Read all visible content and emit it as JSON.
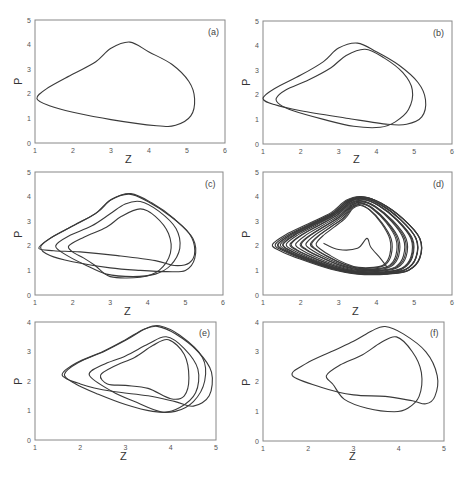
{
  "chart_data": [
    {
      "type": "line",
      "panel": "(a)",
      "xlabel": "Z",
      "ylabel": "P",
      "xlim": [
        1,
        6
      ],
      "ylim": [
        0,
        5
      ],
      "xticks": [
        "1",
        "2",
        "3",
        "4",
        "5",
        "6"
      ],
      "yticks": [
        "0",
        "1",
        "2",
        "3",
        "4",
        "5"
      ],
      "box": [
        35,
        20,
        225,
        143
      ],
      "series": [
        {
          "name": "period-1 orbit",
          "points": [
            [
              1.05,
              1.8
            ],
            [
              1.3,
              2.2
            ],
            [
              2.0,
              2.8
            ],
            [
              2.6,
              3.3
            ],
            [
              3.0,
              3.85
            ],
            [
              3.5,
              4.1
            ],
            [
              4.0,
              3.7
            ],
            [
              4.6,
              3.2
            ],
            [
              5.05,
              2.5
            ],
            [
              5.2,
              1.8
            ],
            [
              5.1,
              1.1
            ],
            [
              4.7,
              0.72
            ],
            [
              4.2,
              0.7
            ],
            [
              3.0,
              0.95
            ],
            [
              2.0,
              1.25
            ],
            [
              1.4,
              1.5
            ],
            [
              1.05,
              1.8
            ]
          ]
        }
      ]
    },
    {
      "type": "line",
      "panel": "(b)",
      "xlabel": "Z",
      "ylabel": "P",
      "xlim": [
        1,
        6
      ],
      "ylim": [
        0,
        5
      ],
      "xticks": [
        "1",
        "2",
        "3",
        "4",
        "5",
        "6"
      ],
      "yticks": [
        "0",
        "1",
        "2",
        "3",
        "4",
        "5"
      ],
      "box": [
        263,
        21,
        452,
        144
      ],
      "series": [
        {
          "name": "outer loop",
          "points": [
            [
              1.0,
              1.85
            ],
            [
              1.3,
              2.25
            ],
            [
              2.0,
              2.8
            ],
            [
              2.6,
              3.35
            ],
            [
              3.0,
              3.9
            ],
            [
              3.5,
              4.1
            ],
            [
              4.0,
              3.75
            ],
            [
              4.6,
              3.2
            ],
            [
              5.1,
              2.5
            ],
            [
              5.3,
              1.8
            ],
            [
              5.2,
              1.1
            ],
            [
              4.8,
              0.8
            ],
            [
              4.3,
              0.8
            ],
            [
              3.2,
              1.05
            ],
            [
              2.0,
              1.35
            ],
            [
              1.3,
              1.6
            ],
            [
              1.0,
              1.85
            ]
          ]
        },
        {
          "name": "inner loop",
          "points": [
            [
              1.35,
              1.85
            ],
            [
              1.6,
              2.2
            ],
            [
              2.2,
              2.6
            ],
            [
              2.8,
              3.1
            ],
            [
              3.2,
              3.6
            ],
            [
              3.7,
              3.85
            ],
            [
              4.2,
              3.5
            ],
            [
              4.7,
              2.9
            ],
            [
              4.95,
              2.2
            ],
            [
              4.85,
              1.4
            ],
            [
              4.5,
              0.9
            ],
            [
              4.1,
              0.68
            ],
            [
              3.4,
              0.72
            ],
            [
              2.6,
              1.0
            ],
            [
              1.8,
              1.35
            ],
            [
              1.45,
              1.6
            ],
            [
              1.35,
              1.85
            ]
          ]
        }
      ]
    },
    {
      "type": "line",
      "panel": "(c)",
      "xlabel": "Z",
      "ylabel": "P",
      "xlim": [
        1,
        6
      ],
      "ylim": [
        0,
        5
      ],
      "xticks": [
        "1",
        "2",
        "3",
        "4",
        "5",
        "6"
      ],
      "yticks": [
        "0",
        "1",
        "2",
        "3",
        "4",
        "5"
      ],
      "box": [
        35,
        172,
        223,
        295
      ],
      "series": [
        {
          "name": "loop 1",
          "points": [
            [
              1.1,
              1.9
            ],
            [
              1.4,
              2.3
            ],
            [
              2.0,
              2.8
            ],
            [
              2.6,
              3.3
            ],
            [
              3.0,
              3.85
            ],
            [
              3.5,
              4.1
            ],
            [
              4.0,
              3.8
            ],
            [
              4.6,
              3.2
            ],
            [
              5.1,
              2.5
            ],
            [
              5.25,
              1.8
            ],
            [
              5.1,
              1.3
            ],
            [
              4.7,
              1.2
            ],
            [
              4.2,
              1.4
            ],
            [
              3.2,
              1.6
            ],
            [
              2.2,
              1.75
            ],
            [
              1.5,
              1.8
            ],
            [
              1.1,
              1.9
            ]
          ]
        },
        {
          "name": "loop 2",
          "points": [
            [
              1.15,
              1.95
            ],
            [
              1.45,
              2.35
            ],
            [
              2.05,
              2.85
            ],
            [
              2.65,
              3.35
            ],
            [
              3.05,
              3.9
            ],
            [
              3.55,
              4.12
            ],
            [
              4.1,
              3.75
            ],
            [
              4.7,
              3.1
            ],
            [
              5.2,
              2.3
            ],
            [
              5.25,
              1.5
            ],
            [
              5.0,
              1.0
            ],
            [
              4.5,
              0.95
            ],
            [
              3.8,
              1.0
            ],
            [
              3.0,
              1.1
            ],
            [
              2.0,
              1.35
            ],
            [
              1.4,
              1.6
            ],
            [
              1.15,
              1.95
            ]
          ]
        },
        {
          "name": "loop 3",
          "points": [
            [
              1.55,
              2.0
            ],
            [
              1.9,
              2.4
            ],
            [
              2.5,
              2.8
            ],
            [
              3.0,
              3.3
            ],
            [
              3.4,
              3.7
            ],
            [
              3.8,
              3.8
            ],
            [
              4.3,
              3.4
            ],
            [
              4.75,
              2.7
            ],
            [
              4.85,
              1.9
            ],
            [
              4.6,
              1.2
            ],
            [
              4.2,
              0.85
            ],
            [
              3.6,
              0.75
            ],
            [
              2.9,
              0.85
            ],
            [
              2.3,
              1.25
            ],
            [
              1.8,
              1.65
            ],
            [
              1.55,
              2.0
            ]
          ]
        },
        {
          "name": "loop 4",
          "points": [
            [
              1.9,
              2.0
            ],
            [
              2.3,
              2.35
            ],
            [
              2.9,
              2.75
            ],
            [
              3.3,
              3.2
            ],
            [
              3.8,
              3.5
            ],
            [
              4.2,
              3.2
            ],
            [
              4.55,
              2.5
            ],
            [
              4.6,
              1.7
            ],
            [
              4.3,
              1.0
            ],
            [
              3.8,
              0.72
            ],
            [
              3.0,
              0.75
            ],
            [
              2.6,
              1.2
            ],
            [
              2.3,
              1.5
            ],
            [
              2.0,
              1.75
            ],
            [
              1.9,
              2.0
            ]
          ]
        }
      ]
    },
    {
      "type": "line",
      "panel": "(d)",
      "xlabel": "Z",
      "ylabel": "P",
      "xlim": [
        1,
        6
      ],
      "ylim": [
        0,
        5
      ],
      "xticks": [
        "1",
        "2",
        "3",
        "4",
        "5",
        "6"
      ],
      "yticks": [
        "0",
        "1",
        "2",
        "3",
        "4",
        "5"
      ],
      "box": [
        263,
        172,
        452,
        295
      ],
      "chaotic": true,
      "base_shape": [
        [
          1.25,
          2.05
        ],
        [
          1.6,
          2.45
        ],
        [
          2.2,
          2.9
        ],
        [
          2.8,
          3.35
        ],
        [
          3.2,
          3.85
        ],
        [
          3.6,
          4.0
        ],
        [
          4.1,
          3.75
        ],
        [
          4.7,
          3.1
        ],
        [
          5.15,
          2.3
        ],
        [
          5.15,
          1.5
        ],
        [
          4.85,
          1.0
        ],
        [
          4.3,
          0.85
        ],
        [
          3.5,
          0.85
        ],
        [
          2.8,
          1.05
        ],
        [
          2.0,
          1.45
        ],
        [
          1.45,
          1.8
        ],
        [
          1.25,
          2.05
        ]
      ],
      "scales": [
        1.0,
        0.98,
        0.96,
        0.94,
        0.92,
        0.9,
        0.88,
        0.85,
        0.82,
        0.78,
        0.74,
        0.7,
        0.66,
        0.62,
        0.58,
        0.54,
        0.5
      ],
      "center": [
        3.5,
        2.2
      ],
      "cusp": [
        [
          2.6,
          2.1
        ],
        [
          3.0,
          1.85
        ],
        [
          3.5,
          1.9
        ],
        [
          3.75,
          2.3
        ],
        [
          3.85,
          1.95
        ],
        [
          4.1,
          1.5
        ],
        [
          4.3,
          1.1
        ]
      ]
    },
    {
      "type": "line",
      "panel": "(e)",
      "xlabel": "Z",
      "ylabel": "P",
      "xlim": [
        1,
        5
      ],
      "ylim": [
        0,
        4
      ],
      "xticks": [
        "1",
        "2",
        "3",
        "4",
        "5"
      ],
      "yticks": [
        "0",
        "1",
        "2",
        "3",
        "4"
      ],
      "box": [
        35,
        322,
        216,
        440
      ],
      "series": [
        {
          "name": "loop 1",
          "points": [
            [
              1.6,
              2.2
            ],
            [
              1.9,
              2.6
            ],
            [
              2.5,
              3.0
            ],
            [
              3.0,
              3.4
            ],
            [
              3.4,
              3.75
            ],
            [
              3.7,
              3.85
            ],
            [
              4.1,
              3.6
            ],
            [
              4.6,
              3.0
            ],
            [
              4.9,
              2.3
            ],
            [
              4.85,
              1.5
            ],
            [
              4.5,
              1.15
            ],
            [
              4.1,
              1.3
            ],
            [
              3.5,
              1.5
            ],
            [
              2.7,
              1.65
            ],
            [
              2.0,
              1.9
            ],
            [
              1.6,
              2.2
            ]
          ]
        },
        {
          "name": "loop 2",
          "points": [
            [
              1.65,
              2.22
            ],
            [
              1.95,
              2.62
            ],
            [
              2.55,
              3.02
            ],
            [
              3.05,
              3.42
            ],
            [
              3.45,
              3.78
            ],
            [
              3.75,
              3.87
            ],
            [
              4.2,
              3.55
            ],
            [
              4.7,
              2.8
            ],
            [
              4.75,
              2.0
            ],
            [
              4.5,
              1.3
            ],
            [
              4.1,
              0.97
            ],
            [
              3.6,
              0.97
            ],
            [
              3.0,
              1.2
            ],
            [
              2.4,
              1.55
            ],
            [
              1.9,
              1.9
            ],
            [
              1.65,
              2.22
            ]
          ]
        },
        {
          "name": "loop 3",
          "points": [
            [
              2.2,
              2.2
            ],
            [
              2.5,
              2.55
            ],
            [
              3.0,
              2.85
            ],
            [
              3.5,
              3.25
            ],
            [
              3.9,
              3.5
            ],
            [
              4.3,
              3.1
            ],
            [
              4.6,
              2.4
            ],
            [
              4.55,
              1.6
            ],
            [
              4.2,
              1.1
            ],
            [
              3.8,
              0.95
            ],
            [
              3.2,
              1.3
            ],
            [
              2.7,
              1.65
            ],
            [
              2.2,
              2.2
            ]
          ]
        },
        {
          "name": "loop 4",
          "points": [
            [
              2.45,
              2.2
            ],
            [
              2.75,
              2.5
            ],
            [
              3.2,
              2.8
            ],
            [
              3.6,
              3.2
            ],
            [
              3.95,
              3.4
            ],
            [
              4.3,
              2.9
            ],
            [
              4.4,
              2.1
            ],
            [
              4.3,
              1.5
            ],
            [
              4.0,
              1.4
            ],
            [
              3.5,
              1.75
            ],
            [
              3.0,
              1.85
            ],
            [
              2.6,
              1.9
            ],
            [
              2.45,
              2.2
            ]
          ]
        }
      ]
    },
    {
      "type": "line",
      "panel": "(f)",
      "xlabel": "Z",
      "ylabel": "P",
      "xlim": [
        1,
        5
      ],
      "ylim": [
        0,
        4
      ],
      "xticks": [
        "1",
        "2",
        "3",
        "4",
        "5"
      ],
      "yticks": [
        "0",
        "1",
        "2",
        "3",
        "4"
      ],
      "box": [
        263,
        322,
        444,
        441
      ],
      "series": [
        {
          "name": "outer loop",
          "points": [
            [
              1.65,
              2.2
            ],
            [
              1.95,
              2.6
            ],
            [
              2.5,
              3.0
            ],
            [
              3.0,
              3.35
            ],
            [
              3.4,
              3.7
            ],
            [
              3.7,
              3.85
            ],
            [
              4.1,
              3.6
            ],
            [
              4.6,
              3.0
            ],
            [
              4.85,
              2.2
            ],
            [
              4.8,
              1.5
            ],
            [
              4.6,
              1.25
            ],
            [
              4.3,
              1.35
            ],
            [
              3.7,
              1.5
            ],
            [
              3.0,
              1.55
            ],
            [
              2.3,
              1.8
            ],
            [
              1.65,
              2.2
            ]
          ]
        },
        {
          "name": "inner loop",
          "points": [
            [
              2.4,
              2.2
            ],
            [
              2.7,
              2.55
            ],
            [
              3.2,
              2.9
            ],
            [
              3.6,
              3.3
            ],
            [
              3.95,
              3.5
            ],
            [
              4.3,
              3.0
            ],
            [
              4.5,
              2.3
            ],
            [
              4.45,
              1.5
            ],
            [
              4.2,
              1.1
            ],
            [
              3.9,
              0.98
            ],
            [
              3.3,
              1.1
            ],
            [
              2.8,
              1.4
            ],
            [
              2.55,
              1.9
            ],
            [
              2.4,
              2.2
            ]
          ]
        }
      ]
    }
  ],
  "panels": [
    {
      "tag": "(a)",
      "xlabel": "Z",
      "ylabel": "P"
    },
    {
      "tag": "(b)",
      "xlabel": "Z",
      "ylabel": "P"
    },
    {
      "tag": "(c)",
      "xlabel": "Z",
      "ylabel": "P"
    },
    {
      "tag": "(d)",
      "xlabel": "Z",
      "ylabel": "P"
    },
    {
      "tag": "(e)",
      "xlabel": "Z",
      "ylabel": "P"
    },
    {
      "tag": "(f)",
      "xlabel": "Z",
      "ylabel": "P"
    }
  ],
  "colors": {
    "line": "#3a3a3a",
    "axis": "#888888",
    "text": "#333333"
  }
}
